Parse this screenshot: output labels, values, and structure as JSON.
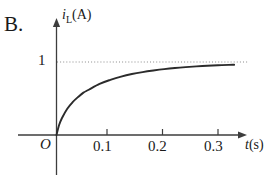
{
  "option_label": "B.",
  "chart_data": {
    "type": "line",
    "title": "",
    "subtitle": "",
    "xlabel": "t (s)",
    "ylabel": "i_L (A)",
    "ylabel_parts": {
      "variable": "i",
      "subscript": "L",
      "unit": "(A)"
    },
    "xlabel_parts": {
      "variable": "t",
      "unit": "(s)"
    },
    "origin_label": "O",
    "xlim": [
      0,
      0.34
    ],
    "ylim": [
      0,
      1.18
    ],
    "xticks": [
      0.1,
      0.2,
      0.3
    ],
    "xtick_labels": [
      "0.1",
      "0.2",
      "0.3"
    ],
    "yticks": [
      1
    ],
    "ytick_labels": [
      "1"
    ],
    "grid": false,
    "legend": null,
    "asymptote": {
      "value": 1,
      "style": "dotted",
      "label": "1",
      "color": "#b3b3b3"
    },
    "series": [
      {
        "name": "inductor current",
        "shape": "exponential-rise",
        "color": "#2b2b2b",
        "final_value": 1,
        "x": [
          0,
          0.005,
          0.01,
          0.02,
          0.03,
          0.04,
          0.05,
          0.06,
          0.08,
          0.1,
          0.12,
          0.14,
          0.16,
          0.18,
          0.2,
          0.22,
          0.24,
          0.26,
          0.28,
          0.3,
          0.32,
          0.33
        ],
        "y": [
          0,
          0.14,
          0.23,
          0.36,
          0.45,
          0.52,
          0.58,
          0.62,
          0.7,
          0.755,
          0.8,
          0.835,
          0.862,
          0.884,
          0.903,
          0.918,
          0.93,
          0.94,
          0.948,
          0.955,
          0.961,
          0.963
        ]
      }
    ]
  },
  "colors": {
    "axis": "#3d3d3d",
    "curve": "#2b2b2b",
    "dotted": "#bdbdbd",
    "text": "#1a1a1a",
    "background": "#ffffff"
  }
}
